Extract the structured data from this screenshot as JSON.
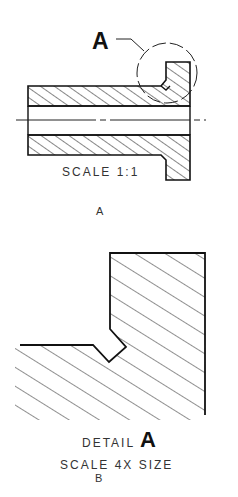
{
  "view_a": {
    "callout_letter": "A",
    "scale_label": "SCALE 1:1",
    "caption": "A"
  },
  "view_b": {
    "detail_word": "DETAIL",
    "detail_letter": "A",
    "scale_label": "SCALE 4X SIZE",
    "caption": "B"
  },
  "colors": {
    "line": "#111111",
    "text": "#333333",
    "background": "#ffffff"
  }
}
